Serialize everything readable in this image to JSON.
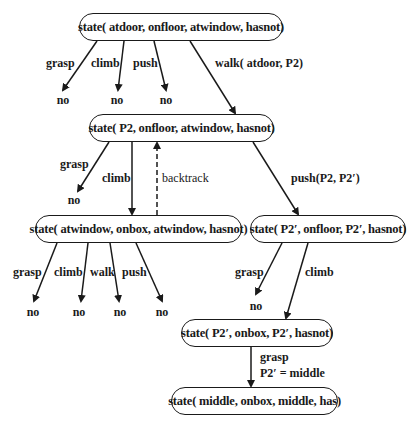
{
  "diagram": {
    "type": "search-tree",
    "nodes": [
      {
        "id": "n1",
        "label": "state( atdoor, onfloor, atwindow, hasnot)"
      },
      {
        "id": "n2",
        "label": "state( P2, onfloor, atwindow, hasnot)"
      },
      {
        "id": "n3",
        "label": "state( atwindow, onbox, atwindow, hasnot)"
      },
      {
        "id": "n4",
        "label": "state( P2′, onfloor, P2′, hasnot)"
      },
      {
        "id": "n5",
        "label": "state( P2′, onbox, P2′, hasnot)"
      },
      {
        "id": "n6",
        "label": "state( middle, onbox, middle, has)"
      }
    ],
    "edges": [
      {
        "from": "n1",
        "to": "no",
        "label": "grasp"
      },
      {
        "from": "n1",
        "to": "no",
        "label": "climb"
      },
      {
        "from": "n1",
        "to": "no",
        "label": "push"
      },
      {
        "from": "n1",
        "to": "n2",
        "label": "walk( atdoor, P2)"
      },
      {
        "from": "n2",
        "to": "no",
        "label": "grasp"
      },
      {
        "from": "n2",
        "to": "n3",
        "label": "climb"
      },
      {
        "from": "n3",
        "to": "n2",
        "label": "backtrack",
        "style": "dashed"
      },
      {
        "from": "n2",
        "to": "n4",
        "label": "push(P2, P2′)"
      },
      {
        "from": "n3",
        "to": "no",
        "label": "grasp"
      },
      {
        "from": "n3",
        "to": "no",
        "label": "climb"
      },
      {
        "from": "n3",
        "to": "no",
        "label": "walk"
      },
      {
        "from": "n3",
        "to": "no",
        "label": "push"
      },
      {
        "from": "n4",
        "to": "no",
        "label": "grasp"
      },
      {
        "from": "n4",
        "to": "n5",
        "label": "climb"
      },
      {
        "from": "n5",
        "to": "n6",
        "label": "grasp",
        "note": "P2′ = middle"
      }
    ],
    "fail_label": "no"
  }
}
